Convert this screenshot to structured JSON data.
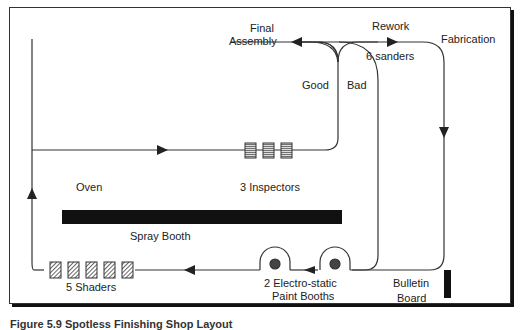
{
  "diagram": {
    "labels": {
      "final_assembly_line1": "Final",
      "final_assembly_line2": "Assembly",
      "rework": "Rework",
      "sanders": "6 sanders",
      "fabrication": "Fabrication",
      "good": "Good",
      "bad": "Bad",
      "oven": "Oven",
      "inspectors": "3 Inspectors",
      "spray_booth": "Spray Booth",
      "shaders": "5 Shaders",
      "paint_booths_line1": "2 Electro-static",
      "paint_booths_line2": "Paint Booths",
      "bulletin_line1": "Bulletin",
      "bulletin_line2": "Board"
    },
    "counts": {
      "inspectors": 3,
      "sanders": 6,
      "shaders": 5,
      "paint_booths": 2
    },
    "caption": "Figure 5.9  Spotless Finishing Shop Layout"
  }
}
